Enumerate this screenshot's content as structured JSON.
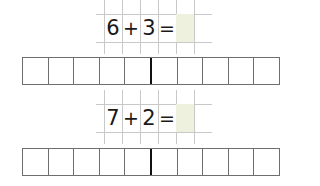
{
  "equations": [
    {
      "cells": [
        "6",
        "+",
        "3",
        "="
      ],
      "answer": "",
      "answer_fill": "#eef1de"
    },
    {
      "cells": [
        "7",
        "+",
        "2",
        "="
      ],
      "answer": "",
      "answer_fill": "#eef1de"
    }
  ],
  "ten_frames": [
    {
      "cells": 10,
      "divider_after": 5,
      "filled": []
    },
    {
      "cells": 10,
      "divider_after": 5,
      "filled": []
    }
  ]
}
